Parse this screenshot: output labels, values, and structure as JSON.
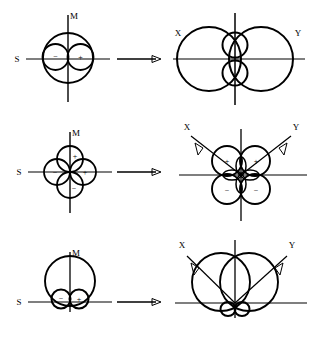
{
  "figure": {
    "title": "",
    "rows": [
      {
        "id": "row-sigma",
        "left": {
          "axis_labels": {
            "horizontal": "S",
            "vertical": "M"
          },
          "signs": [
            "−",
            "+"
          ],
          "shape": "circle-with-two-horizontal-lobes"
        },
        "arrow": "→",
        "right": {
          "axis_labels": {
            "left_diagonal": "X",
            "right_diagonal": "Y"
          },
          "signs": [],
          "shape": "two-large-horizontal-circles-with-two-small-vertical-lobes"
        }
      },
      {
        "id": "row-delta",
        "left": {
          "axis_labels": {
            "horizontal": "S",
            "vertical": "M"
          },
          "signs": [
            "+",
            "+",
            "−",
            "−"
          ],
          "shape": "four-lobe-clover-on-axes"
        },
        "arrow": "→",
        "right": {
          "axis_labels": {
            "left_diagonal": "X",
            "right_diagonal": "Y"
          },
          "signs": [
            "+",
            "+",
            "−",
            "−"
          ],
          "shape": "four-lobe-clover-in-quadrants"
        }
      },
      {
        "id": "row-pi",
        "left": {
          "axis_labels": {
            "horizontal": "S",
            "vertical": "M"
          },
          "signs": [
            "−",
            "+"
          ],
          "shape": "large-upper-circle-with-two-small-lower-lobes"
        },
        "arrow": "→",
        "right": {
          "axis_labels": {
            "left_diagonal": "X",
            "right_diagonal": "Y"
          },
          "signs": [],
          "shape": "two-overlapping-upper-circles-with-small-lower-lobes"
        }
      }
    ],
    "colors": {
      "stroke": "#000000",
      "axis": "#3a3a3a",
      "background": "#ffffff"
    }
  }
}
